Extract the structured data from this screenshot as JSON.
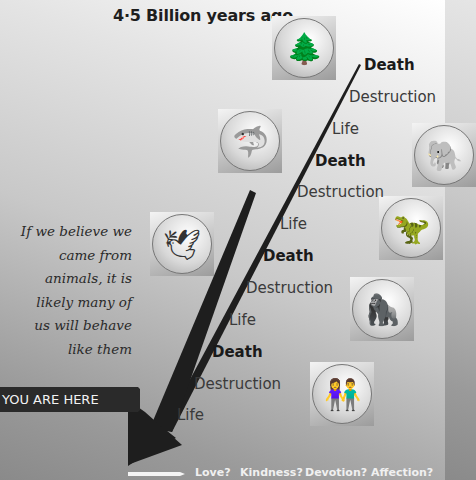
{
  "title": "4·5 Billion years ago",
  "timeline_labels": [
    {
      "text": "Death",
      "weight": "bold"
    },
    {
      "text": "Destruction",
      "weight": "normal"
    },
    {
      "text": "Life",
      "weight": "normal"
    },
    {
      "text": "Death",
      "weight": "bold"
    },
    {
      "text": "Destruction",
      "weight": "normal"
    },
    {
      "text": "Life",
      "weight": "normal"
    },
    {
      "text": "Death",
      "weight": "bold"
    },
    {
      "text": "Destruction",
      "weight": "normal"
    },
    {
      "text": "Life",
      "weight": "normal"
    },
    {
      "text": "Death",
      "weight": "bold"
    },
    {
      "text": "Destruction",
      "weight": "normal"
    },
    {
      "text": "Life",
      "weight": "normal"
    }
  ],
  "images": [
    {
      "name": "trees",
      "glyph": "🌲"
    },
    {
      "name": "shark",
      "glyph": "🦈"
    },
    {
      "name": "elephant",
      "glyph": "🐘"
    },
    {
      "name": "dinosaur",
      "glyph": "🦖"
    },
    {
      "name": "bird",
      "glyph": "🕊"
    },
    {
      "name": "ape",
      "glyph": "🦍"
    },
    {
      "name": "couple",
      "glyph": "👫"
    }
  ],
  "quote": {
    "lines": [
      "If we believe we",
      "came from",
      "animals, it is",
      "likely many of",
      "us will behave",
      "like them"
    ]
  },
  "you_are_here": "YOU ARE HERE",
  "questions": [
    "Love?",
    "Kindness?",
    "Devotion?",
    "Affection?"
  ],
  "colors": {
    "arrow": "#1e1e1e",
    "banner": "#2a2a2a",
    "question_text": "#f0f0f0"
  }
}
